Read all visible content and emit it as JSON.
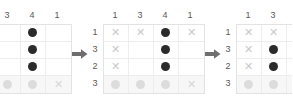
{
  "diagram": {
    "colors": {
      "filled_dark": "#2b2b2b",
      "filled_medium": "#4d4d4d",
      "filled_faint": "#dcdcdc",
      "cross": "#c9c9c9",
      "clue_text": "#575757",
      "grid_line": "#ededed",
      "grid_border": "#e3e3e3",
      "faded_row_bg": "#f7f7f7",
      "arrow": "#6e6e6e"
    },
    "arrow_icon": "arrow-right-icon",
    "arrows": [
      "→",
      "→"
    ],
    "panels": [
      {
        "name": "step-1",
        "col_clues": [
          "1",
          "3",
          "4",
          "1"
        ],
        "row_clues": [
          "1",
          "3",
          "2",
          "3"
        ],
        "rows": [
          {
            "faded": false,
            "cells": [
              "empty",
              "empty",
              "dot",
              "empty"
            ]
          },
          {
            "faded": false,
            "cells": [
              "empty",
              "empty",
              "dot",
              "empty"
            ]
          },
          {
            "faded": false,
            "cells": [
              "empty",
              "empty",
              "dot",
              "empty"
            ]
          },
          {
            "faded": true,
            "cells": [
              "dot-faint",
              "dot-faint",
              "dot-faint",
              "cross"
            ]
          }
        ]
      },
      {
        "name": "step-2",
        "col_clues": [
          "1",
          "3",
          "4",
          "1"
        ],
        "row_clues": [
          "1",
          "3",
          "2",
          "3"
        ],
        "rows": [
          {
            "faded": false,
            "cells": [
              "cross",
              "cross",
              "dot",
              "cross"
            ]
          },
          {
            "faded": false,
            "cells": [
              "cross",
              "empty",
              "dot",
              "empty"
            ]
          },
          {
            "faded": false,
            "cells": [
              "cross",
              "empty",
              "dot",
              "empty"
            ]
          },
          {
            "faded": true,
            "cells": [
              "dot-faint",
              "dot-faint",
              "dot-faint",
              "cross"
            ]
          }
        ]
      },
      {
        "name": "step-3",
        "col_clues": [
          "1",
          "3",
          "4",
          "1"
        ],
        "row_clues": [
          "1",
          "3",
          "2",
          "3"
        ],
        "rows": [
          {
            "faded": false,
            "cells": [
              "cross",
              "cross",
              "dot-medium",
              "cross"
            ]
          },
          {
            "faded": false,
            "cells": [
              "cross",
              "dot",
              "dot-medium",
              "dot"
            ]
          },
          {
            "faded": false,
            "cells": [
              "cross",
              "dot",
              "dot-medium",
              "cross"
            ]
          },
          {
            "faded": true,
            "cells": [
              "dot-faint",
              "dot-faint",
              "dot-faint",
              "cross"
            ]
          }
        ]
      }
    ]
  }
}
